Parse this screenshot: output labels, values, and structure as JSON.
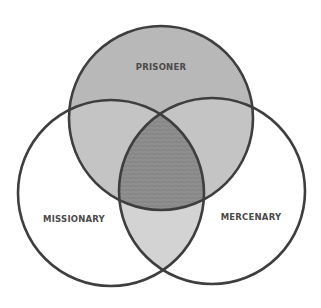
{
  "diagram": {
    "type": "venn-3",
    "sets": [
      {
        "id": "prisoner",
        "label": "PRISONER",
        "cx": 161,
        "cy": 118,
        "r": 92
      },
      {
        "id": "missionary",
        "label": "MISSIONARY",
        "cx": 111,
        "cy": 193,
        "r": 93
      },
      {
        "id": "mercenary",
        "label": "MERCENARY",
        "cx": 212,
        "cy": 191,
        "r": 93
      }
    ],
    "colors": {
      "stroke": "#3e3e3e",
      "prisoner_fill": "#b8b8b8",
      "pair_overlap_fill": "#cfcfcf",
      "center_fill": "#8c8c8c",
      "background": "#ffffff"
    }
  }
}
